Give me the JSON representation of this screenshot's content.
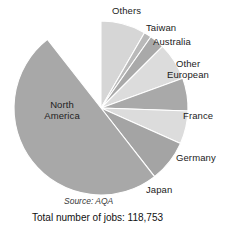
{
  "chart_data": {
    "type": "pie",
    "title": "",
    "subtitle": "",
    "xlabel": "",
    "ylabel": "",
    "legend_position": "outside-labels",
    "grid": false,
    "start_angle_deg": 0,
    "direction": "clockwise",
    "total_label": "Total number of jobs: 118,753",
    "total_value": 118753,
    "source_label": "Source: AQA",
    "categories": [
      "Others",
      "Taiwan",
      "Australia",
      "Other European",
      "France",
      "Germany",
      "Japan",
      "North America"
    ],
    "values": [
      8.3,
      1.4,
      2.8,
      6.9,
      6.1,
      6.1,
      7.8,
      60.6
    ],
    "units": "percent",
    "slices": [
      {
        "label": "Others",
        "value": 8.3,
        "angle_deg": 30,
        "color": "#d6d6d6",
        "label_x": 112,
        "label_y": 9,
        "label_align": "left"
      },
      {
        "label": "Taiwan",
        "value": 1.4,
        "angle_deg": 5,
        "color": "#b9b9b9",
        "label_x": 148,
        "label_y": 25,
        "label_align": "left"
      },
      {
        "label": "Australia",
        "value": 2.8,
        "angle_deg": 10,
        "color": "#a9a9a9",
        "label_x": 155,
        "label_y": 38,
        "label_align": "left"
      },
      {
        "label": "Other European",
        "value": 6.9,
        "angle_deg": 25,
        "color": "#dcdcdc",
        "label_x": 170,
        "label_y": 60,
        "label_align": "right"
      },
      {
        "label": "France",
        "value": 6.1,
        "angle_deg": 22,
        "color": "#a9a9a9",
        "label_x": 186,
        "label_y": 110,
        "label_align": "right"
      },
      {
        "label": "Germany",
        "value": 6.1,
        "angle_deg": 22,
        "color": "#dcdcdc",
        "label_x": 189,
        "label_y": 153,
        "label_align": "right"
      },
      {
        "label": "Japan",
        "value": 7.8,
        "angle_deg": 28,
        "color": "#a4a4a4",
        "label_x": 148,
        "label_y": 185,
        "label_align": "left"
      },
      {
        "label": "North America",
        "value": 60.6,
        "angle_deg": 180,
        "color": "#a8a8a8",
        "label_x": 36,
        "label_y": 100,
        "label_align": "center"
      }
    ]
  },
  "labels": {
    "others": "Others",
    "taiwan": "Taiwan",
    "australia": "Australia",
    "other_european_line1": "Other",
    "other_european_line2": "European",
    "france": "France",
    "germany": "Germany",
    "japan": "Japan",
    "north_america_line1": "North",
    "north_america_line2": "America"
  },
  "footer": {
    "source": "Source: AQA",
    "total": "Total number of jobs: 118,753"
  },
  "colors": {
    "background": "#ffffff",
    "slice_edge": "#ffffff",
    "text": "#1a1a1a",
    "north_america": "#a8a8a8",
    "others": "#d6d6d6",
    "taiwan": "#b9b9b9",
    "australia": "#a9a9a9",
    "other_european": "#dcdcdc",
    "france": "#a9a9a9",
    "germany": "#dcdcdc",
    "japan": "#a4a4a4"
  },
  "geometry": {
    "center_x": 101,
    "center_y": 108,
    "radius": 87
  }
}
